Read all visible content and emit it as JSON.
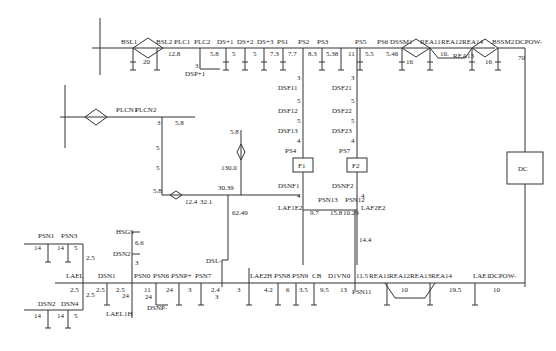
{
  "diagram": {
    "type": "railway-track-layout",
    "top_line": {
      "stations": [
        {
          "id": "bsl1",
          "label": "BSL1"
        },
        {
          "id": "bsl2",
          "label": "BSL2"
        },
        {
          "id": "plc1",
          "label": "PLC1"
        },
        {
          "id": "plc2",
          "label": "PLC2"
        },
        {
          "id": "dsp1",
          "label": "DS+1"
        },
        {
          "id": "dsp2",
          "label": "DS+2"
        },
        {
          "id": "dsp3",
          "label": "DS+3"
        },
        {
          "id": "ps1",
          "label": "PS1"
        },
        {
          "id": "ps2",
          "label": "PS2"
        },
        {
          "id": "ps3",
          "label": "PS3"
        },
        {
          "id": "ps5",
          "label": "PS5"
        },
        {
          "id": "ps6",
          "label": "PS6"
        },
        {
          "id": "dssm1",
          "label": "DSSM1"
        },
        {
          "id": "rea11",
          "label": "REA11"
        },
        {
          "id": "rea12",
          "label": "REA12"
        },
        {
          "id": "rea14",
          "label": "REA14"
        },
        {
          "id": "bssm2",
          "label": "BSSM2"
        },
        {
          "id": "dcpow",
          "label": "DCPOW-"
        },
        {
          "id": "dspp1",
          "label": "DSP+1"
        },
        {
          "id": "rea13",
          "label": "REA13"
        }
      ],
      "distances": [
        "20",
        "12.8",
        "3",
        "5.8",
        "5",
        "5",
        "7.3",
        "7.7",
        "8.3",
        "5.38",
        "11",
        "5.5",
        "5.46",
        "16",
        "10.",
        "16",
        "70"
      ]
    },
    "branch_f1": {
      "labels": [
        "DSF11",
        "DSF12",
        "DSF13",
        "PS4",
        "DSNF1",
        "LAF1E2"
      ],
      "distances": [
        "3",
        "5",
        "5",
        "4",
        "4",
        "9.7"
      ],
      "box": "F1"
    },
    "branch_f2": {
      "labels": [
        "DSF21",
        "DSF22",
        "DSF23",
        "PS7",
        "DSNF2",
        "LAF2E2"
      ],
      "distances": [
        "3",
        "5",
        "5",
        "4",
        "4",
        "10.29"
      ],
      "box": "F2"
    },
    "mid_link": {
      "labels": [
        "PSN13",
        "PSN12"
      ],
      "distances": [
        "15.8",
        "14.4"
      ]
    },
    "dc_box": "DC",
    "plc_branch": {
      "labels": [
        "PLCN1",
        "PLCN2"
      ],
      "distances": [
        "3",
        "5.8",
        "5",
        "5",
        "5.8",
        "12.4",
        "32.1",
        "30.39",
        "130.0",
        "5.8",
        "62.49"
      ]
    },
    "bottom_line": {
      "left_group": {
        "labels": [
          "PSN1",
          "PSN3",
          "DSN2",
          "DSN4",
          "LAEL"
        ],
        "distances": [
          "14",
          "14",
          "5",
          "14",
          "14",
          "5",
          "2.5",
          "2.5",
          "2.5"
        ]
      },
      "stations": [
        {
          "id": "dsn1",
          "label": "DSN1"
        },
        {
          "id": "psn0",
          "label": "PSN0"
        },
        {
          "id": "psn6",
          "label": "PSN6"
        },
        {
          "id": "psnp",
          "label": "PSNP+"
        },
        {
          "id": "psn7",
          "label": "PSN7"
        },
        {
          "id": "lae2h",
          "label": "LAE2H"
        },
        {
          "id": "psn8",
          "label": "PSN8"
        },
        {
          "id": "psn9",
          "label": "PSN9"
        },
        {
          "id": "cb",
          "label": "CB"
        },
        {
          "id": "d1vn0",
          "label": "D1VN0"
        },
        {
          "id": "psn11",
          "label": "PSN11"
        },
        {
          "id": "rea11b",
          "label": "REA11"
        },
        {
          "id": "rea12b",
          "label": "REA12"
        },
        {
          "id": "rea13b",
          "label": "REA13"
        },
        {
          "id": "rea14b",
          "label": "REA14"
        },
        {
          "id": "lae1",
          "label": "LAE1"
        },
        {
          "id": "dcpowb",
          "label": "DCPOW-"
        }
      ],
      "extra_labels": [
        "HSGS",
        "DSN2",
        "LAEL1H",
        "DSNP-",
        "DSL-"
      ],
      "distances": [
        "2.5",
        "2.5",
        "24",
        "11",
        "24",
        "24",
        "3",
        "2.4",
        "3",
        "3",
        "4.2",
        "6",
        "3.5",
        "9.5",
        "13",
        "11.5",
        "10",
        "19.5",
        "10",
        "6.6",
        "3"
      ]
    }
  }
}
